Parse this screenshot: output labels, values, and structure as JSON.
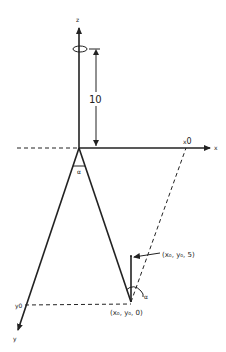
{
  "diagram": {
    "axes": {
      "x": "x",
      "y": "y",
      "z": "z"
    },
    "height_label": "10",
    "x_intercept_label": "x",
    "x_intercept_sub": "0",
    "y_intercept_label": "y",
    "y_intercept_sub": "0",
    "angle_top": "α",
    "angle_bottom": "α",
    "point_top": "(x₀, y₀, 5)",
    "point_bottom": "(x₀, y₀, 0)"
  },
  "colors": {
    "line": "#222222",
    "background": "#ffffff"
  }
}
